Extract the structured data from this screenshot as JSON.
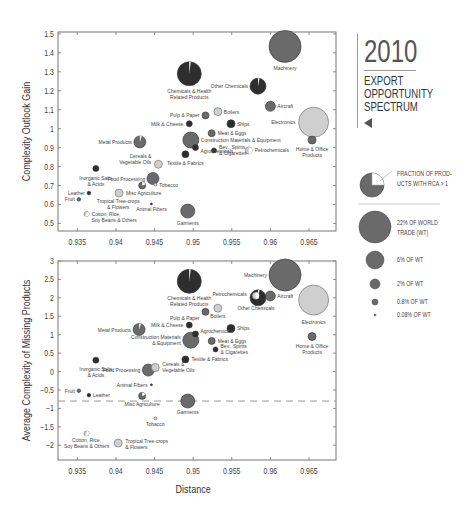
{
  "title": {
    "year": "2010",
    "lines": [
      "EXPORT",
      "OPPORTUNITY",
      "SPECTRUM"
    ],
    "arrow_icon": "triangle-left"
  },
  "legend": {
    "pie_label_1": "FRACTION OF PROD-",
    "pie_label_2": "UCTS WITH RCA > 1",
    "sizes": [
      {
        "label_1": "22% OF WORLD",
        "label_2": "TRADE (WT)",
        "r": 16
      },
      {
        "label_1": "6% OF WT",
        "label_2": "",
        "r": 9
      },
      {
        "label_1": "2% OF WT",
        "label_2": "",
        "r": 5
      },
      {
        "label_1": "0.8% OF WT",
        "label_2": "",
        "r": 3
      },
      {
        "label_1": "0.08% OF WT",
        "label_2": "",
        "r": 1
      }
    ]
  },
  "colors": {
    "dark": "#2e2e2e",
    "mid": "#6a6a6a",
    "light": "#cfcfcf",
    "axis": "#777777",
    "dashed": "#999999"
  },
  "chart_data": [
    {
      "type": "scatter",
      "title": "2010 Export Opportunity Spectrum",
      "xlabel": "",
      "ylabel": "Complexity Outlook Gain",
      "xlim": [
        0.9325,
        0.9685
      ],
      "ylim": [
        0.46,
        1.51
      ],
      "xticks": [
        0.935,
        0.94,
        0.945,
        0.95,
        0.955,
        0.96,
        0.965
      ],
      "xtick_labels": [
        "0.935",
        "0.94",
        "0.945",
        "0.95",
        "0.955",
        "0.96",
        "0.965"
      ],
      "yticks": [
        0.5,
        0.6,
        0.7,
        0.8,
        0.9,
        1,
        1.1,
        1.2,
        1.3,
        1.4,
        1.5
      ],
      "ytick_labels": [
        "0.5",
        "0.6",
        "0.7",
        "0.8",
        "0.9",
        "1",
        "1.1",
        "1.2",
        "1.3",
        "1.4",
        "1.5"
      ],
      "points": [
        {
          "name": "Machinery",
          "x": 0.9619,
          "y": 1.434,
          "r": 16,
          "shade": "mid",
          "rca": 0,
          "lx": 0,
          "ly": 24,
          "anchor": "middle"
        },
        {
          "name": "Chemicals & Health|Related Products",
          "x": 0.9495,
          "y": 1.29,
          "r": 12,
          "shade": "dark",
          "rca": 0.02,
          "lx": 0,
          "ly": 19,
          "anchor": "middle"
        },
        {
          "name": "Other Chemicals",
          "x": 0.9584,
          "y": 1.224,
          "r": 8,
          "shade": "dark",
          "rca": 0.03,
          "lx": -10,
          "ly": 2,
          "anchor": "end"
        },
        {
          "name": "Aircraft",
          "x": 0.96,
          "y": 1.118,
          "r": 5,
          "shade": "mid",
          "rca": 0,
          "lx": 7,
          "ly": 2,
          "anchor": "start"
        },
        {
          "name": "Pulp & Paper",
          "x": 0.9516,
          "y": 1.07,
          "r": 3.5,
          "shade": "mid",
          "rca": 0,
          "lx": -6,
          "ly": 2,
          "anchor": "end"
        },
        {
          "name": "Boilers",
          "x": 0.9532,
          "y": 1.09,
          "r": 4,
          "shade": "light",
          "rca": 0,
          "lx": 6,
          "ly": 2,
          "anchor": "start"
        },
        {
          "name": "Electronics",
          "x": 0.9656,
          "y": 1.034,
          "r": 15,
          "shade": "light",
          "rca": 0,
          "lx": -18,
          "ly": 2,
          "anchor": "end"
        },
        {
          "name": "Milk & Cheese",
          "x": 0.9495,
          "y": 1.026,
          "r": 3,
          "shade": "dark",
          "rca": 0,
          "lx": -6,
          "ly": 2,
          "anchor": "end"
        },
        {
          "name": "Ships",
          "x": 0.9549,
          "y": 1.026,
          "r": 4,
          "shade": "dark",
          "rca": 0,
          "lx": 6,
          "ly": 2,
          "anchor": "start"
        },
        {
          "name": "Home & Office|Products",
          "x": 0.9654,
          "y": 0.94,
          "r": 4,
          "shade": "mid",
          "rca": 0,
          "lx": 0,
          "ly": 11,
          "anchor": "middle"
        },
        {
          "name": "Meat & Eggs",
          "x": 0.9524,
          "y": 0.976,
          "r": 3.5,
          "shade": "mid",
          "rca": 0,
          "lx": 6,
          "ly": 2,
          "anchor": "start"
        },
        {
          "name": "Construction Materials & Equipment",
          "x": 0.9497,
          "y": 0.94,
          "r": 8,
          "shade": "mid",
          "rca": 0,
          "lx": 10,
          "ly": 2,
          "anchor": "start"
        },
        {
          "name": "Agrochemicals",
          "x": 0.9503,
          "y": 0.9,
          "r": 3,
          "shade": "dark",
          "rca": 0,
          "lx": 5,
          "ly": 5,
          "anchor": "start"
        },
        {
          "name": "Metal Products",
          "x": 0.9431,
          "y": 0.93,
          "r": 6,
          "shade": "mid",
          "rca": 0.05,
          "lx": -8,
          "ly": 2,
          "anchor": "end"
        },
        {
          "name": "Textile & Fabrics",
          "x": 0.949,
          "y": 0.865,
          "r": 3.5,
          "shade": "dark",
          "rca": 0,
          "lx": 0,
          "ly": 11,
          "anchor": "middle"
        },
        {
          "name": "Bev., Spirits|& Cigarettes",
          "x": 0.9527,
          "y": 0.885,
          "r": 2.5,
          "shade": "dark",
          "rca": 0,
          "lx": 5,
          "ly": -1,
          "anchor": "start"
        },
        {
          "name": "Petrochemicals",
          "x": 0.9572,
          "y": 0.885,
          "r": 3.5,
          "shade": "light",
          "rca": 0.5,
          "lx": 6,
          "ly": 2,
          "anchor": "start"
        },
        {
          "name": "Cereals &|Vegetable Oils",
          "x": 0.9455,
          "y": 0.812,
          "r": 4,
          "shade": "light",
          "rca": 0,
          "lx": -7,
          "ly": -6,
          "anchor": "end"
        },
        {
          "name": "Inorganic Salts|& Acids",
          "x": 0.9374,
          "y": 0.79,
          "r": 3,
          "shade": "dark",
          "rca": 0,
          "lx": 0,
          "ly": 12,
          "anchor": "middle"
        },
        {
          "name": "Food Processing",
          "x": 0.9448,
          "y": 0.737,
          "r": 6,
          "shade": "mid",
          "rca": 0,
          "lx": -8,
          "ly": 2,
          "anchor": "end"
        },
        {
          "name": "Misc Agriculture",
          "x": 0.9434,
          "y": 0.7,
          "r": 3.5,
          "shade": "mid",
          "rca": 0.2,
          "lx": 0,
          "ly": 0,
          "anchor": "start",
          "nolabel": true
        },
        {
          "name": "Tobacco",
          "x": 0.9451,
          "y": 0.705,
          "r": 1.5,
          "shade": "light",
          "rca": 0,
          "lx": 4,
          "ly": 2,
          "anchor": "start"
        },
        {
          "name": "Misc Agriculture",
          "x": 0.9404,
          "y": 0.66,
          "r": 4,
          "shade": "light",
          "rca": 0,
          "lx": 7,
          "ly": 2,
          "anchor": "start"
        },
        {
          "name": "Leather",
          "x": 0.9365,
          "y": 0.66,
          "r": 1.8,
          "shade": "dark",
          "rca": 0,
          "lx": -4,
          "ly": 2,
          "anchor": "end"
        },
        {
          "name": "Fruit",
          "x": 0.9352,
          "y": 0.627,
          "r": 1.8,
          "shade": "mid",
          "rca": 0,
          "lx": -4,
          "ly": 2,
          "anchor": "end"
        },
        {
          "name": "Tropical Tree-crops|& Flowers",
          "x": 0.9403,
          "y": 0.606,
          "r": 0,
          "shade": "light",
          "rca": 0,
          "lx": 0,
          "ly": 0,
          "anchor": "middle"
        },
        {
          "name": "Animal Fibers",
          "x": 0.9446,
          "y": 0.603,
          "r": 1,
          "shade": "dark",
          "rca": 0,
          "lx": 0,
          "ly": 7,
          "anchor": "middle"
        },
        {
          "name": "Cotton, Rice,|Soy Beans & Others",
          "x": 0.9362,
          "y": 0.55,
          "r": 2.5,
          "shade": "light",
          "rca": 0.6,
          "lx": 5,
          "ly": 2,
          "anchor": "start"
        },
        {
          "name": "Garments",
          "x": 0.9493,
          "y": 0.565,
          "r": 7,
          "shade": "mid",
          "rca": 0,
          "lx": 0,
          "ly": 14,
          "anchor": "middle"
        }
      ]
    },
    {
      "type": "scatter",
      "xlabel": "Distance",
      "ylabel": "Average Complexity of Missing Products",
      "xlim": [
        0.9325,
        0.9685
      ],
      "ylim": [
        -2.4,
        3.0
      ],
      "xticks": [
        0.935,
        0.94,
        0.945,
        0.95,
        0.955,
        0.96,
        0.965
      ],
      "xtick_labels": [
        "0.935",
        "0.94",
        "0.945",
        "0.95",
        "0.955",
        "0.96",
        "0.965"
      ],
      "yticks": [
        -2,
        -1.5,
        -1,
        -0.5,
        0,
        0.5,
        1,
        1.5,
        2,
        2.5,
        3
      ],
      "ytick_labels": [
        "−2",
        "−1.5",
        "−1",
        "−0.5",
        "0",
        "0.5",
        "1",
        "1.5",
        "2",
        "2.5",
        "3"
      ],
      "dashed_line_y": -0.8,
      "points": [
        {
          "name": "Machinery",
          "x": 0.9619,
          "y": 2.62,
          "r": 16,
          "shade": "mid",
          "rca": 0,
          "lx": -18,
          "ly": 2,
          "anchor": "end"
        },
        {
          "name": "Chemicals & Health|Related Products",
          "x": 0.9495,
          "y": 2.45,
          "r": 12,
          "shade": "dark",
          "rca": 0.02,
          "lx": 0,
          "ly": 19,
          "anchor": "middle"
        },
        {
          "name": "Electronics",
          "x": 0.9656,
          "y": 1.94,
          "r": 15,
          "shade": "light",
          "rca": 0,
          "lx": 0,
          "ly": 24,
          "anchor": "middle"
        },
        {
          "name": "Other Chemicals",
          "x": 0.9584,
          "y": 2.0,
          "r": 8,
          "shade": "dark",
          "rca": 0.03,
          "lx": -2,
          "ly": 12,
          "anchor": "middle"
        },
        {
          "name": "Aircraft",
          "x": 0.96,
          "y": 2.05,
          "r": 5,
          "shade": "mid",
          "rca": 0,
          "lx": 7,
          "ly": 2,
          "anchor": "start"
        },
        {
          "name": "Petrochemicals",
          "x": 0.9581,
          "y": 2.06,
          "r": 3.5,
          "shade": "light",
          "rca": 0.5,
          "lx": -9,
          "ly": 0,
          "anchor": "end"
        },
        {
          "name": "Boilers",
          "x": 0.9532,
          "y": 1.72,
          "r": 4,
          "shade": "light",
          "rca": 0,
          "lx": 0,
          "ly": 10,
          "anchor": "middle"
        },
        {
          "name": "Pulp & Paper",
          "x": 0.9516,
          "y": 1.62,
          "r": 3.5,
          "shade": "mid",
          "rca": 0,
          "lx": -6,
          "ly": 8,
          "anchor": "end"
        },
        {
          "name": "Milk & Cheese",
          "x": 0.9495,
          "y": 1.26,
          "r": 3,
          "shade": "dark",
          "rca": 0,
          "lx": -6,
          "ly": 2,
          "anchor": "end"
        },
        {
          "name": "Ships",
          "x": 0.9549,
          "y": 1.17,
          "r": 4,
          "shade": "dark",
          "rca": 0,
          "lx": 6,
          "ly": 2,
          "anchor": "start"
        },
        {
          "name": "Home & Office|Products",
          "x": 0.9654,
          "y": 0.95,
          "r": 4,
          "shade": "mid",
          "rca": 0,
          "lx": 0,
          "ly": 11,
          "anchor": "middle"
        },
        {
          "name": "Metal Products",
          "x": 0.943,
          "y": 1.14,
          "r": 6,
          "shade": "mid",
          "rca": 0.05,
          "lx": -8,
          "ly": 2,
          "anchor": "end"
        },
        {
          "name": "Construction Materials|& Equipment",
          "x": 0.9497,
          "y": 0.85,
          "r": 8,
          "shade": "mid",
          "rca": 0,
          "lx": -10,
          "ly": -1,
          "anchor": "end"
        },
        {
          "name": "Agrochemicals",
          "x": 0.9503,
          "y": 1.02,
          "r": 3,
          "shade": "dark",
          "rca": 0,
          "lx": 5,
          "ly": -1,
          "anchor": "start"
        },
        {
          "name": "Meat & Eggs",
          "x": 0.9524,
          "y": 0.83,
          "r": 3.5,
          "shade": "mid",
          "rca": 0,
          "lx": 6,
          "ly": 2,
          "anchor": "start"
        },
        {
          "name": "Bev., Spirits|& Cigarettes",
          "x": 0.9529,
          "y": 0.6,
          "r": 2.5,
          "shade": "dark",
          "rca": 0,
          "lx": 5,
          "ly": -1,
          "anchor": "start"
        },
        {
          "name": "Textile & Fabrics",
          "x": 0.949,
          "y": 0.33,
          "r": 3.5,
          "shade": "dark",
          "rca": 0,
          "lx": 6,
          "ly": 2,
          "anchor": "start"
        },
        {
          "name": "Food Processing",
          "x": 0.9442,
          "y": 0.04,
          "r": 6,
          "shade": "mid",
          "rca": 0,
          "lx": -8,
          "ly": 2,
          "anchor": "end"
        },
        {
          "name": "Cereals &|Vegetable Oils",
          "x": 0.9451,
          "y": 0.11,
          "r": 4,
          "shade": "light",
          "rca": 0,
          "lx": 7,
          "ly": -2,
          "anchor": "start"
        },
        {
          "name": "Inorganic Salts|& Acids",
          "x": 0.9374,
          "y": 0.31,
          "r": 3,
          "shade": "dark",
          "rca": 0,
          "lx": 0,
          "ly": 11,
          "anchor": "middle"
        },
        {
          "name": "Animal Fibers",
          "x": 0.9446,
          "y": -0.36,
          "r": 1,
          "shade": "dark",
          "rca": 0,
          "lx": -4,
          "ly": 2,
          "anchor": "end"
        },
        {
          "name": "Fruit",
          "x": 0.9352,
          "y": -0.52,
          "r": 1.8,
          "shade": "mid",
          "rca": 0,
          "lx": -4,
          "ly": 2,
          "anchor": "end"
        },
        {
          "name": "Leather",
          "x": 0.9365,
          "y": -0.64,
          "r": 1.8,
          "shade": "dark",
          "rca": 0,
          "lx": 4,
          "ly": 2,
          "anchor": "start"
        },
        {
          "name": "Misc Agriculture",
          "x": 0.9434,
          "y": -0.66,
          "r": 3.5,
          "shade": "mid",
          "rca": 0.2,
          "lx": 0,
          "ly": 10,
          "anchor": "middle"
        },
        {
          "name": "Garments",
          "x": 0.9493,
          "y": -0.8,
          "r": 7,
          "shade": "mid",
          "rca": 0,
          "lx": 0,
          "ly": 13,
          "anchor": "middle"
        },
        {
          "name": "Tobacco",
          "x": 0.9451,
          "y": -1.27,
          "r": 1.5,
          "shade": "light",
          "rca": 0,
          "lx": 0,
          "ly": 8,
          "anchor": "middle"
        },
        {
          "name": "Cotton, Rice,|Soy Beans & Others",
          "x": 0.9362,
          "y": -1.68,
          "r": 2.5,
          "shade": "light",
          "rca": 0.6,
          "lx": 0,
          "ly": 9,
          "anchor": "middle"
        },
        {
          "name": "Tropical Tree-crops|& Flowers",
          "x": 0.9403,
          "y": -1.94,
          "r": 4,
          "shade": "light",
          "rca": 0,
          "lx": 7,
          "ly": 0,
          "anchor": "start"
        }
      ]
    }
  ]
}
